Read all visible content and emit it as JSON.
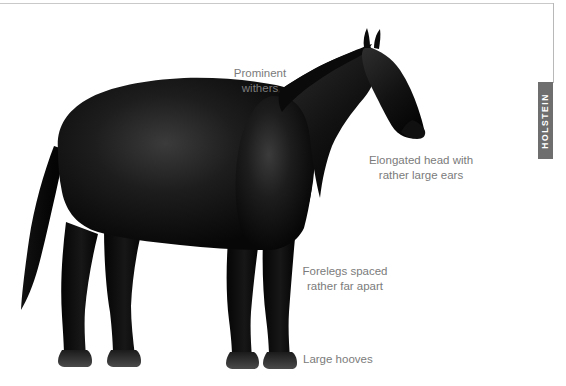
{
  "page": {
    "background_color": "#ffffff",
    "width": 566,
    "height": 386
  },
  "section_tab": {
    "label": "HOLSTEIN",
    "background_color": "#6e6e6e",
    "text_color": "#ffffff"
  },
  "illustration": {
    "subject": "horse-side-profile-silhouette",
    "alt_text": "Black Holstein horse standing in left-facing side profile",
    "silhouette_color": "#0a0a0a",
    "hoof_color": "#3a3a3a"
  },
  "callouts": [
    {
      "id": "withers",
      "line1": "Prominent",
      "line2": "withers"
    },
    {
      "id": "head",
      "line1": "Elongated head with",
      "line2": "rather large ears"
    },
    {
      "id": "forelegs",
      "line1": "Forelegs spaced",
      "line2": "rather far apart"
    },
    {
      "id": "hooves",
      "line1": "Large hooves",
      "line2": ""
    }
  ],
  "label_color": "#7b7b7b"
}
